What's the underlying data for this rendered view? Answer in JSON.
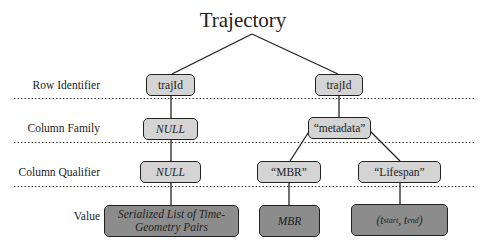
{
  "title": "Trajectory",
  "rows": {
    "row_identifier": "Row Identifier",
    "column_family": "Column Family",
    "column_qualifier": "Column Qualifier",
    "value": "Value"
  },
  "left_branch": {
    "row_id": "trajId",
    "column_family": "NULL",
    "column_qualifier": "NULL",
    "value_line1": "Serialized List of Time-",
    "value_line2": "Geometry Pairs"
  },
  "right_branch": {
    "row_id": "trajId",
    "column_family": "“metadata”",
    "qualifier_mbr": "“MBR”",
    "qualifier_lifespan": "“Lifespan”",
    "value_mbr": "MBR",
    "value_lifespan_open": "(",
    "value_lifespan_t1": "t",
    "value_lifespan_sub1": "start",
    "value_lifespan_sep": ", ",
    "value_lifespan_t2": "t",
    "value_lifespan_sub2": "end",
    "value_lifespan_close": ")"
  },
  "colors": {
    "light_box": "#d4d4d4",
    "dark_box": "#8c8c8c",
    "line": "#222222"
  }
}
